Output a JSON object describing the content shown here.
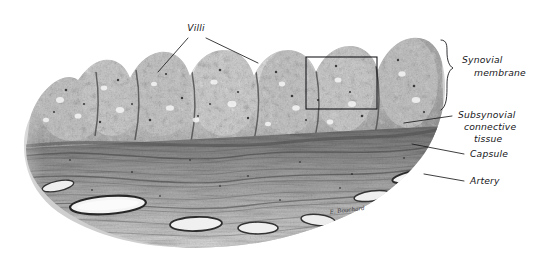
{
  "figure": {
    "kind": "histology-micrograph",
    "subject": "synovial membrane",
    "palette": {
      "background": "#ffffff",
      "tissue_light": "#d8d8d8",
      "tissue_mid": "#a0a0a0",
      "tissue_dark": "#5a5a5a",
      "tissue_darkest": "#2a2a2a",
      "ink": "#1b1b1f"
    },
    "signature": "E. Bouchard"
  },
  "labels": [
    {
      "id": "villi",
      "text": "Villi",
      "x": 196,
      "y": 31,
      "anchor": "middle",
      "lines": 1
    },
    {
      "id": "synovial-membrane",
      "line1": "Synovial",
      "line2": "membrane",
      "x": 462,
      "y": 63,
      "anchor": "start"
    },
    {
      "id": "subsynovial-connective-tissue",
      "line1": "Subsynovial",
      "line2": "connective",
      "line3": "tissue",
      "x": 458,
      "y": 118,
      "anchor": "start"
    },
    {
      "id": "capsule",
      "text": "Capsule",
      "x": 470,
      "y": 157,
      "anchor": "start"
    },
    {
      "id": "artery",
      "text": "Artery",
      "x": 470,
      "y": 184,
      "anchor": "start"
    }
  ],
  "annotations": {
    "inset_box": {
      "x": 306,
      "y": 57,
      "width": 71,
      "height": 52
    },
    "brace": {
      "x": 443,
      "y_top": 40,
      "y_bottom": 110,
      "tip_y": 68
    },
    "leaders": [
      {
        "id": "villi-left",
        "from": [
          188,
          38
        ],
        "to": [
          158,
          72
        ]
      },
      {
        "id": "villi-right",
        "from": [
          206,
          38
        ],
        "to": [
          258,
          63
        ]
      },
      {
        "id": "subsynovial",
        "from": [
          452,
          116
        ],
        "to": [
          404,
          123
        ]
      },
      {
        "id": "capsule",
        "from": [
          464,
          154
        ],
        "to": [
          412,
          144
        ]
      },
      {
        "id": "artery",
        "from": [
          464,
          181
        ],
        "to": [
          424,
          174
        ]
      }
    ]
  }
}
